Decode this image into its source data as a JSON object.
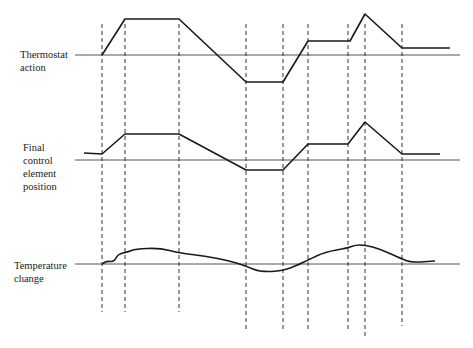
{
  "labels": {
    "thermostat": "Thermostat\naction",
    "final_control": "Final\ncontrol\nelement\nposition",
    "temperature": "Temperature\nchange"
  },
  "colors": {
    "trace": "#1a1a1a",
    "axis": "#555555",
    "guide": "#333333"
  },
  "axes_y": {
    "thermostat": 55,
    "final_control": 160,
    "temperature": 264
  },
  "guide_x": [
    102,
    125,
    179,
    246,
    283,
    308,
    348,
    365,
    402
  ],
  "thermostat_path": [
    [
      102,
      55
    ],
    [
      125,
      19
    ],
    [
      179,
      19
    ],
    [
      246,
      82
    ],
    [
      283,
      82
    ],
    [
      308,
      41
    ],
    [
      350,
      41
    ],
    [
      365,
      14
    ],
    [
      402,
      48
    ],
    [
      450,
      48
    ]
  ],
  "final_control_path": [
    [
      84,
      153
    ],
    [
      102,
      154
    ],
    [
      125,
      134
    ],
    [
      179,
      134
    ],
    [
      246,
      170
    ],
    [
      283,
      170
    ],
    [
      308,
      144
    ],
    [
      348,
      144
    ],
    [
      365,
      122
    ],
    [
      402,
      154
    ],
    [
      440,
      154
    ]
  ],
  "temperature_path": [
    [
      102,
      264
    ],
    [
      107,
      261
    ],
    [
      114,
      262
    ],
    [
      118,
      254
    ],
    [
      128,
      252
    ],
    [
      135,
      249
    ],
    [
      160,
      248
    ],
    [
      179,
      253
    ],
    [
      205,
      256
    ],
    [
      230,
      261
    ],
    [
      246,
      266
    ],
    [
      260,
      272
    ],
    [
      283,
      271
    ],
    [
      300,
      264
    ],
    [
      308,
      260
    ],
    [
      325,
      252
    ],
    [
      348,
      248
    ],
    [
      355,
      245
    ],
    [
      365,
      245
    ],
    [
      380,
      249
    ],
    [
      402,
      259
    ],
    [
      410,
      262
    ],
    [
      420,
      262
    ],
    [
      435,
      261
    ]
  ]
}
